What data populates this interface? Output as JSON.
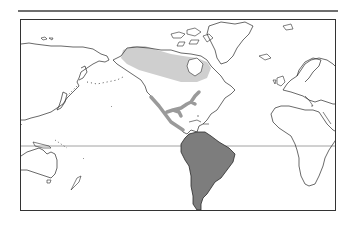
{
  "map": {
    "projection": "world-equirectangular-pacific-left",
    "colors": {
      "background": "#ffffff",
      "coastline": "#2a2a2a",
      "equator": "#8a8a8a",
      "frame": "#333333",
      "top_rule": "#6f6f6f",
      "range_light": "#cfcfcf",
      "range_medium": "#9a9a9a",
      "range_dark": "#7d7d7d"
    },
    "regions": [
      {
        "name": "north-american-boreal-range",
        "shade": "light"
      },
      {
        "name": "mexico-central-america-gulf-coast-range",
        "shade": "medium"
      },
      {
        "name": "south-america-range",
        "shade": "dark"
      }
    ],
    "reference_lines": [
      {
        "name": "equator"
      }
    ]
  }
}
